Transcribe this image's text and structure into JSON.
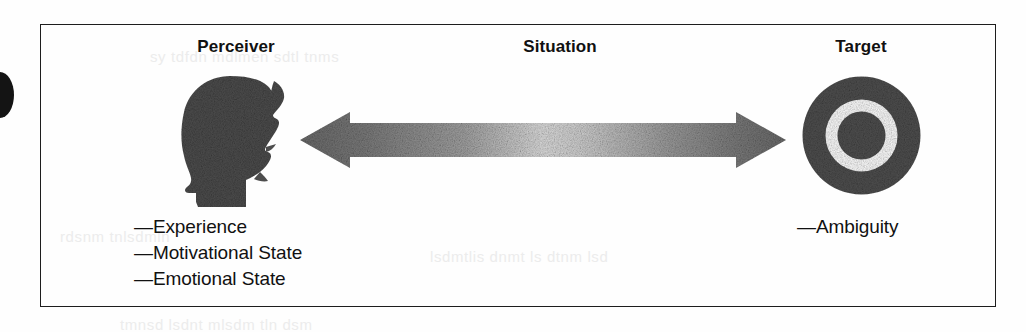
{
  "figure": {
    "columns": {
      "perceiver_title": "Perceiver",
      "situation_title": "Situation",
      "target_title": "Target"
    },
    "perceiver": {
      "icon": "head-silhouette-icon",
      "attributes": [
        "—Experience",
        "—Motivational State",
        "—Emotional State"
      ]
    },
    "situation": {
      "icon": "double-headed-arrow-icon"
    },
    "target": {
      "icon": "bullseye-target-icon",
      "attributes": [
        "—Ambiguity"
      ]
    },
    "colors": {
      "border": "#1d1d1d",
      "silhouette": "#4d4d4d",
      "arrow_dark": "#6f6f6f",
      "arrow_light": "#d8d8d8",
      "target_ring": "#4f4f4f",
      "text": "#111111",
      "background": "#fefefe"
    }
  },
  "artifacts": {
    "showthrough_text": [
      "sy tdfdn mdlmen sdtl tnms",
      "rdsnm tnlsdmln",
      "lsdmtlis dnmt ls dtnm lsd",
      "tmnsd lsdnt mlsdm tln dsm"
    ]
  }
}
